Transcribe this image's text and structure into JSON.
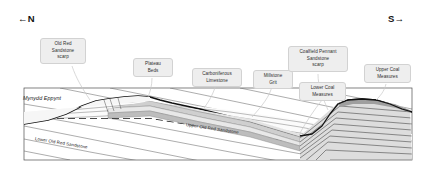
{
  "figure": {
    "type": "geological-cross-section",
    "orientation_labels": {
      "left": "←N",
      "right": "S→"
    },
    "locality_label": "Mynydd\nEppynt",
    "callouts": [
      {
        "id": "old-red-sandstone-scarp",
        "text": "Old Red\nSandstone\nscarp"
      },
      {
        "id": "plateau-beds",
        "text": "Plateau\nBeds"
      },
      {
        "id": "carboniferous-limestone",
        "text": "Carboniferous\nLimestone"
      },
      {
        "id": "millstone-grit",
        "text": "Millstone\nGrit"
      },
      {
        "id": "coalfield-pennant-sandstone-scarp",
        "text": "Coalfield Pennant\nSandstone\nscarp"
      },
      {
        "id": "lower-coal-measures",
        "text": "Lower Coal\nMeasures"
      },
      {
        "id": "upper-coal-measures",
        "text": "Upper Coal\nMeasures"
      }
    ],
    "bed_labels": [
      {
        "id": "lower-old-red-sandstone",
        "text": "Lower Old Red Sandstone"
      },
      {
        "id": "upper-old-red-sandstone",
        "text": "Upper Old Red Sandstone"
      }
    ],
    "colors": {
      "callout_fill": "#eeeeee",
      "callout_border": "#d2d2d2",
      "line": "#1a1a1a",
      "strata_light": "#f2f2f2",
      "strata_mid": "#d9d9d9",
      "strata_dark": "#b9b9b9",
      "frame": "#4d4d4d",
      "background": "#ffffff"
    }
  }
}
